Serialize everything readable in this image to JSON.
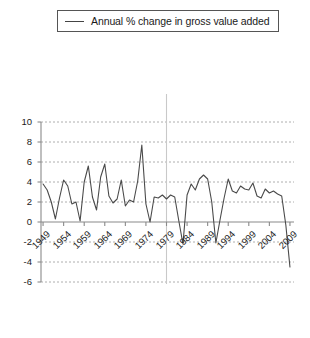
{
  "legend": {
    "label": "Annual % change in gross value added",
    "line_color": "#444444",
    "marker_name": "legend-line-swatch"
  },
  "chart_data": {
    "type": "line",
    "title": "",
    "xlabel": "",
    "ylabel": "",
    "xlim": [
      1948.5,
      2009.5
    ],
    "ylim": [
      -6,
      10
    ],
    "yticks": [
      10,
      8,
      6,
      4,
      2,
      0,
      -2,
      -4,
      -6
    ],
    "xticks": [
      1949,
      1954,
      1959,
      1964,
      1969,
      1974,
      1979,
      1984,
      1989,
      1994,
      1999,
      2004,
      2009
    ],
    "grid": true,
    "grid_style": "dashed",
    "grid_color": "#9a9a9a",
    "axis_color": "#8a8a8a",
    "zero_line": true,
    "reference_line_x": 1979,
    "reference_line_color": "#c9c9c9",
    "legend_position": "top",
    "series": [
      {
        "name": "Annual % change in gross value added",
        "color": "#4a4a4a",
        "x": [
          1949,
          1950,
          1951,
          1952,
          1953,
          1954,
          1955,
          1956,
          1957,
          1958,
          1959,
          1960,
          1961,
          1962,
          1963,
          1964,
          1965,
          1966,
          1967,
          1968,
          1969,
          1970,
          1971,
          1972,
          1973,
          1974,
          1975,
          1976,
          1977,
          1978,
          1979,
          1980,
          1981,
          1982,
          1983,
          1984,
          1985,
          1986,
          1987,
          1988,
          1989,
          1990,
          1991,
          1992,
          1993,
          1994,
          1995,
          1996,
          1997,
          1998,
          1999,
          2000,
          2001,
          2002,
          2003,
          2004,
          2005,
          2006,
          2007,
          2008,
          2009
        ],
        "values": [
          3.8,
          3.2,
          2.0,
          0.3,
          2.4,
          4.2,
          3.6,
          1.8,
          2.0,
          0.1,
          4.0,
          5.6,
          2.5,
          1.2,
          4.5,
          5.8,
          2.6,
          1.9,
          2.3,
          4.2,
          1.6,
          2.2,
          2.0,
          4.1,
          7.7,
          1.8,
          0.0,
          2.5,
          2.4,
          2.7,
          2.3,
          2.7,
          2.5,
          0.1,
          -2.2,
          2.7,
          3.8,
          3.2,
          4.3,
          4.7,
          4.3,
          2.0,
          -2.1,
          0.2,
          2.4,
          4.3,
          3.1,
          2.9,
          3.6,
          3.3,
          3.2,
          3.9,
          2.6,
          2.4,
          3.3,
          2.9,
          3.1,
          2.8,
          2.6,
          -0.3,
          -4.5
        ]
      }
    ]
  },
  "axis_geometry": {
    "plot_left_px": 41,
    "plot_right_px": 292,
    "y_top_value_px": 62,
    "zero_px": 222,
    "px_per_unit": 10
  }
}
